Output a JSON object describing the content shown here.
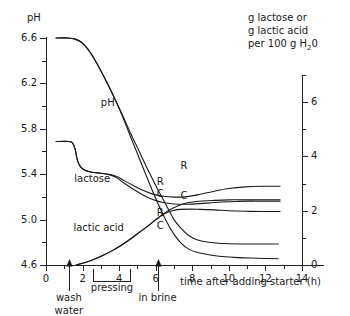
{
  "chart_data": {
    "type": "line",
    "title": "",
    "subtitle": "",
    "xlabel": "time after adding starter (h)",
    "ylabel_left": "pH",
    "ylabel_right_line1": "g lactose or",
    "ylabel_right_line2": "g lactic acid",
    "ylabel_right_line3_pre": "per 100 g H",
    "ylabel_right_line3_sub": "2",
    "ylabel_right_line3_post": "0",
    "xlim": [
      0,
      14
    ],
    "ylim_left": [
      4.6,
      6.6
    ],
    "ylim_right": [
      0,
      7
    ],
    "grid": false,
    "legend": "inline-curve-labels",
    "xticks": [
      0,
      2,
      4,
      6,
      8,
      10,
      12,
      14
    ],
    "xtick_labels": [
      "0",
      "2",
      "4",
      "6",
      "8",
      "10",
      "12",
      "14"
    ],
    "xminor_step": 1,
    "yticks_left": [
      4.6,
      5.0,
      5.4,
      5.8,
      6.2,
      6.6
    ],
    "ytick_labels_left": [
      "4.6",
      "5.0",
      "5.4",
      "5.8",
      "6.2",
      "6.6"
    ],
    "yminor_left_step": 0.2,
    "yticks_right": [
      0,
      2,
      4,
      6
    ],
    "ytick_labels_right": [
      "0",
      "2",
      "4",
      "6"
    ],
    "yminor_right_step": 1,
    "series": [
      {
        "name": "pH R",
        "label": "R",
        "axis": "left",
        "label_x": 7.35,
        "label_y_left": 5.47,
        "points": [
          [
            0.55,
            6.6
          ],
          [
            1.2,
            6.6
          ],
          [
            1.6,
            6.59
          ],
          [
            1.95,
            6.56
          ],
          [
            2.3,
            6.5
          ],
          [
            2.7,
            6.4
          ],
          [
            3.1,
            6.28
          ],
          [
            3.6,
            6.12
          ],
          [
            4.1,
            5.95
          ],
          [
            4.6,
            5.77
          ],
          [
            5.1,
            5.6
          ],
          [
            5.6,
            5.43
          ],
          [
            6.1,
            5.27
          ],
          [
            6.6,
            5.12
          ],
          [
            7.0,
            5.0
          ],
          [
            7.4,
            4.92
          ],
          [
            7.8,
            4.86
          ],
          [
            8.3,
            4.82
          ],
          [
            8.9,
            4.8
          ],
          [
            9.6,
            4.79
          ],
          [
            10.5,
            4.785
          ],
          [
            11.5,
            4.785
          ],
          [
            12.7,
            4.785
          ]
        ]
      },
      {
        "name": "pH C",
        "label": "C",
        "axis": "left",
        "label_x": 7.35,
        "label_y_left": 5.21,
        "points": [
          [
            0.55,
            6.6
          ],
          [
            1.2,
            6.6
          ],
          [
            1.6,
            6.59
          ],
          [
            1.95,
            6.56
          ],
          [
            2.3,
            6.5
          ],
          [
            2.7,
            6.4
          ],
          [
            3.1,
            6.28
          ],
          [
            3.6,
            6.12
          ],
          [
            4.1,
            5.94
          ],
          [
            4.6,
            5.74
          ],
          [
            5.1,
            5.54
          ],
          [
            5.6,
            5.34
          ],
          [
            6.1,
            5.15
          ],
          [
            6.6,
            4.98
          ],
          [
            7.0,
            4.87
          ],
          [
            7.4,
            4.79
          ],
          [
            7.8,
            4.74
          ],
          [
            8.3,
            4.71
          ],
          [
            8.9,
            4.69
          ],
          [
            9.6,
            4.675
          ],
          [
            10.5,
            4.665
          ],
          [
            11.5,
            4.66
          ],
          [
            12.7,
            4.655
          ]
        ]
      },
      {
        "name": "lactose R",
        "label": "R",
        "axis": "right",
        "label_x": 6.05,
        "label_y_right": 3.05,
        "points": [
          [
            0.55,
            4.55
          ],
          [
            1.25,
            4.55
          ],
          [
            1.45,
            4.5
          ],
          [
            1.6,
            4.25
          ],
          [
            1.7,
            3.9
          ],
          [
            1.85,
            3.65
          ],
          [
            2.1,
            3.5
          ],
          [
            2.5,
            3.42
          ],
          [
            3.0,
            3.38
          ],
          [
            3.5,
            3.33
          ],
          [
            3.9,
            3.25
          ],
          [
            4.3,
            3.1
          ],
          [
            4.8,
            2.92
          ],
          [
            5.3,
            2.75
          ],
          [
            5.8,
            2.62
          ],
          [
            6.4,
            2.53
          ],
          [
            7.0,
            2.5
          ],
          [
            7.7,
            2.52
          ],
          [
            8.4,
            2.6
          ],
          [
            9.2,
            2.72
          ],
          [
            10.0,
            2.82
          ],
          [
            10.9,
            2.88
          ],
          [
            11.8,
            2.9
          ],
          [
            12.8,
            2.9
          ]
        ]
      },
      {
        "name": "lactose C",
        "label": "C",
        "axis": "right",
        "label_x": 6.05,
        "label_y_right": 2.6,
        "points": [
          [
            0.55,
            4.55
          ],
          [
            1.25,
            4.55
          ],
          [
            1.45,
            4.5
          ],
          [
            1.6,
            4.25
          ],
          [
            1.7,
            3.9
          ],
          [
            1.85,
            3.65
          ],
          [
            2.1,
            3.5
          ],
          [
            2.5,
            3.42
          ],
          [
            3.0,
            3.38
          ],
          [
            3.5,
            3.32
          ],
          [
            3.9,
            3.2
          ],
          [
            4.3,
            3.0
          ],
          [
            4.8,
            2.78
          ],
          [
            5.3,
            2.58
          ],
          [
            5.8,
            2.42
          ],
          [
            6.4,
            2.3
          ],
          [
            7.0,
            2.25
          ],
          [
            7.7,
            2.24
          ],
          [
            8.4,
            2.26
          ],
          [
            9.2,
            2.3
          ],
          [
            10.0,
            2.33
          ],
          [
            10.9,
            2.35
          ],
          [
            11.8,
            2.35
          ],
          [
            12.8,
            2.35
          ]
        ]
      },
      {
        "name": "lactic acid R",
        "label": "R",
        "axis": "right",
        "label_x": 6.05,
        "label_y_right": 1.92,
        "points": [
          [
            1.65,
            0.0
          ],
          [
            2.1,
            0.08
          ],
          [
            2.6,
            0.2
          ],
          [
            3.1,
            0.35
          ],
          [
            3.6,
            0.52
          ],
          [
            4.1,
            0.72
          ],
          [
            4.6,
            0.95
          ],
          [
            5.1,
            1.2
          ],
          [
            5.6,
            1.45
          ],
          [
            6.1,
            1.72
          ],
          [
            6.5,
            1.92
          ],
          [
            6.9,
            2.08
          ],
          [
            7.3,
            2.2
          ],
          [
            7.8,
            2.3
          ],
          [
            8.4,
            2.35
          ],
          [
            9.2,
            2.38
          ],
          [
            10.0,
            2.4
          ],
          [
            10.9,
            2.4
          ],
          [
            11.8,
            2.4
          ],
          [
            12.8,
            2.4
          ]
        ]
      },
      {
        "name": "lactic acid C",
        "label": "C",
        "axis": "right",
        "label_x": 6.05,
        "label_y_right": 1.42,
        "points": [
          [
            1.65,
            0.0
          ],
          [
            2.1,
            0.08
          ],
          [
            2.6,
            0.2
          ],
          [
            3.1,
            0.35
          ],
          [
            3.6,
            0.52
          ],
          [
            4.1,
            0.72
          ],
          [
            4.6,
            0.95
          ],
          [
            5.1,
            1.2
          ],
          [
            5.6,
            1.45
          ],
          [
            6.1,
            1.72
          ],
          [
            6.5,
            1.9
          ],
          [
            6.9,
            2.0
          ],
          [
            7.3,
            2.05
          ],
          [
            7.8,
            2.06
          ],
          [
            8.4,
            2.05
          ],
          [
            9.2,
            2.03
          ],
          [
            10.0,
            2.0
          ],
          [
            10.9,
            1.98
          ],
          [
            11.8,
            1.97
          ],
          [
            12.8,
            1.97
          ]
        ]
      }
    ],
    "inline_labels": [
      {
        "name": "ph-curve-label",
        "text": "pH",
        "x": 3.0,
        "y_left": 6.03
      },
      {
        "name": "lactose-curve-label",
        "text": "lactose",
        "x": 1.55,
        "y_left": 5.36
      },
      {
        "name": "lactic-acid-curve-label",
        "text": "lactic acid",
        "x": 1.5,
        "y_left": 4.93
      }
    ],
    "annotations": [
      {
        "name": "wash-water-marker",
        "text_line1": "wash",
        "text_line2": "water",
        "x": 1.25,
        "marker": "arrow-up"
      },
      {
        "name": "pressing-bracket",
        "text": "pressing",
        "x_start": 2.55,
        "x_end": 4.6,
        "marker": "bracket"
      },
      {
        "name": "in-brine-marker",
        "text": "in brine",
        "x": 6.1,
        "marker": "arrow-up"
      }
    ]
  }
}
